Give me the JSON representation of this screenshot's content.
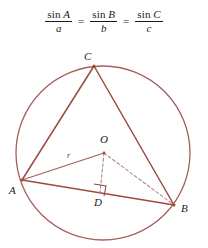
{
  "formula": {
    "name": "law-of-sines",
    "fractions": [
      {
        "func": "sin",
        "angle": "A",
        "denominator": "a"
      },
      {
        "func": "sin",
        "angle": "B",
        "denominator": "b"
      },
      {
        "func": "sin",
        "angle": "C",
        "denominator": "c"
      }
    ],
    "equals": "=",
    "plain_text": "sin A / a = sin B / b = sin C / c"
  },
  "diagram": {
    "labels": {
      "vertex_a": "A",
      "vertex_b": "B",
      "vertex_c": "C",
      "center_o": "O",
      "foot_d": "D",
      "radius_r": "r"
    },
    "colors": {
      "circle_stroke": "#a4605a",
      "triangle_stroke": "#9c4a42",
      "cevian_stroke": "#a4605a",
      "dashed_stroke": "#b08a86",
      "right_angle_stroke": "#8d4a44",
      "label_text": "#1b1b1b",
      "background": "#ffffff"
    },
    "geometry": {
      "circle": {
        "cx": 103,
        "cy": 117,
        "r": 87
      },
      "points": {
        "A": {
          "x": 22,
          "y": 144
        },
        "B": {
          "x": 174,
          "y": 169
        },
        "C": {
          "x": 94,
          "y": 30
        },
        "O": {
          "x": 104,
          "y": 117
        },
        "D": {
          "x": 100,
          "y": 157
        }
      },
      "segments": [
        {
          "name": "side-ca",
          "from": "C",
          "to": "A",
          "style": "solid"
        },
        {
          "name": "side-cb",
          "from": "C",
          "to": "B",
          "style": "solid"
        },
        {
          "name": "side-ab",
          "from": "A",
          "to": "B",
          "style": "solid"
        },
        {
          "name": "radius-ao",
          "from": "A",
          "to": "O",
          "style": "solid"
        },
        {
          "name": "perpendicular-od",
          "from": "O",
          "to": "D",
          "style": "dashed"
        },
        {
          "name": "radius-ob",
          "from": "O",
          "to": "B",
          "style": "dashed"
        }
      ],
      "right_angle_at": "D"
    }
  }
}
